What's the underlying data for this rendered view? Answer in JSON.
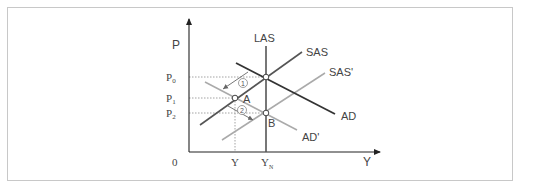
{
  "diagram": {
    "axes": {
      "y_label": "P",
      "x_label": "Y",
      "origin_label": "0"
    },
    "price_levels": [
      {
        "id": "P0",
        "label": "P",
        "sub": "0",
        "y": 77
      },
      {
        "id": "P1",
        "label": "P",
        "sub": "1",
        "y": 98
      },
      {
        "id": "P2",
        "label": "P",
        "sub": "2",
        "y": 113
      }
    ],
    "output_levels": [
      {
        "id": "Y",
        "label": "Y",
        "sub": "",
        "x": 235
      },
      {
        "id": "YN",
        "label": "Y",
        "sub": "N",
        "x": 266
      }
    ],
    "curves": [
      {
        "id": "LAS",
        "label": "LAS",
        "color": "#555555",
        "style": "solid"
      },
      {
        "id": "SAS",
        "label": "SAS",
        "color": "#555555",
        "style": "solid"
      },
      {
        "id": "SAS_prime",
        "label": "SAS'",
        "color": "#aaaaaa",
        "style": "solid"
      },
      {
        "id": "AD",
        "label": "AD",
        "color": "#333333",
        "style": "solid"
      },
      {
        "id": "AD_prime",
        "label": "AD'",
        "color": "#aaaaaa",
        "style": "solid"
      }
    ],
    "points": [
      {
        "id": "E0",
        "label": "",
        "x": 266,
        "y": 77
      },
      {
        "id": "A",
        "label": "A",
        "x": 235,
        "y": 98
      },
      {
        "id": "B",
        "label": "B",
        "x": 266,
        "y": 113
      }
    ],
    "steps": [
      {
        "id": "step1",
        "label": "①"
      },
      {
        "id": "step2",
        "label": "②"
      }
    ],
    "colors": {
      "dark_line": "#444444",
      "light_line": "#aaaaaa",
      "dotted": "#999999",
      "frame": "#c8c8c8",
      "text": "#444444"
    }
  }
}
